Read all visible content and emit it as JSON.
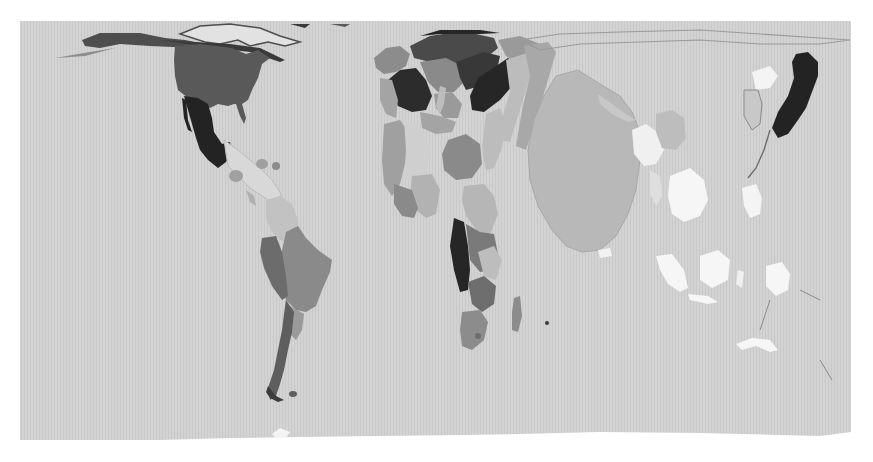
{
  "map": {
    "type": "cartogram",
    "projection": "world equirectangular (distorted)",
    "color_scheme": "grayscale",
    "background": "#ffffff",
    "ocean_color": "#d2d2d2",
    "bounds": {
      "x": 20,
      "y": 21,
      "width": 831,
      "height": 419
    },
    "shade_levels": {
      "white": "#f6f6f6",
      "very_light": "#c8c8c8",
      "light": "#b4b4b4",
      "medium_light": "#a4a4a4",
      "medium": "#8c8c8c",
      "medium_dark": "#6e6e6e",
      "dark": "#4e4e4e",
      "very_dark": "#262626"
    },
    "regions": [
      {
        "name": "Alaska / Arctic North America",
        "shade": "dark"
      },
      {
        "name": "Canada (arctic archipelago)",
        "shade": "dark"
      },
      {
        "name": "United States",
        "shade": "dark"
      },
      {
        "name": "Mexico",
        "shade": "very_dark"
      },
      {
        "name": "Central America",
        "shade": "very_light"
      },
      {
        "name": "Caribbean",
        "shade": "medium"
      },
      {
        "name": "Colombia / Venezuela",
        "shade": "very_light"
      },
      {
        "name": "Brazil",
        "shade": "medium"
      },
      {
        "name": "Peru / Bolivia",
        "shade": "medium_dark"
      },
      {
        "name": "Chile / Argentina",
        "shade": "medium_dark"
      },
      {
        "name": "Western Europe",
        "shade": "medium"
      },
      {
        "name": "Northern/Central Europe",
        "shade": "very_dark"
      },
      {
        "name": "Eastern Europe",
        "shade": "very_dark"
      },
      {
        "name": "Middle East",
        "shade": "medium_light"
      },
      {
        "name": "North Africa",
        "shade": "light"
      },
      {
        "name": "West Africa",
        "shade": "medium_light"
      },
      {
        "name": "Central Africa",
        "shade": "very_dark"
      },
      {
        "name": "East Africa",
        "shade": "medium_dark"
      },
      {
        "name": "Southern Africa",
        "shade": "medium"
      },
      {
        "name": "Madagascar",
        "shade": "medium"
      },
      {
        "name": "Russia / Central Asia",
        "shade": "very_light"
      },
      {
        "name": "China / India (large central Asia blob)",
        "shade": "light"
      },
      {
        "name": "Southeast Asia mainland",
        "shade": "white"
      },
      {
        "name": "Indonesia / Philippines",
        "shade": "white"
      },
      {
        "name": "Korea",
        "shade": "white"
      },
      {
        "name": "Japan",
        "shade": "very_dark"
      },
      {
        "name": "Australia",
        "shade": "white"
      }
    ]
  }
}
